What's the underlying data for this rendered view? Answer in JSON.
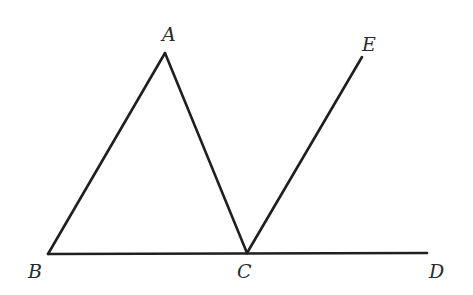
{
  "diagram": {
    "type": "geometry",
    "line_color": "#1f1f1f",
    "label_color": "#2a2a2a",
    "points": {
      "A": {
        "label": "A",
        "x": 165,
        "y": 53,
        "label_x": 162,
        "label_y": 41
      },
      "B": {
        "label": "B",
        "x": 48,
        "y": 254,
        "label_x": 28,
        "label_y": 278
      },
      "C": {
        "label": "C",
        "x": 247,
        "y": 253,
        "label_x": 237,
        "label_y": 278
      },
      "D": {
        "label": "D",
        "x": 427,
        "y": 253,
        "label_x": 429,
        "label_y": 278
      },
      "E": {
        "label": "E",
        "x": 362,
        "y": 57,
        "label_x": 362,
        "label_y": 51
      }
    },
    "segments": [
      {
        "name": "AB",
        "from": "A",
        "to": "B"
      },
      {
        "name": "AC",
        "from": "A",
        "to": "C"
      },
      {
        "name": "BD",
        "from": "B",
        "to": "D"
      },
      {
        "name": "CE",
        "from": "C",
        "to": "E"
      }
    ]
  }
}
